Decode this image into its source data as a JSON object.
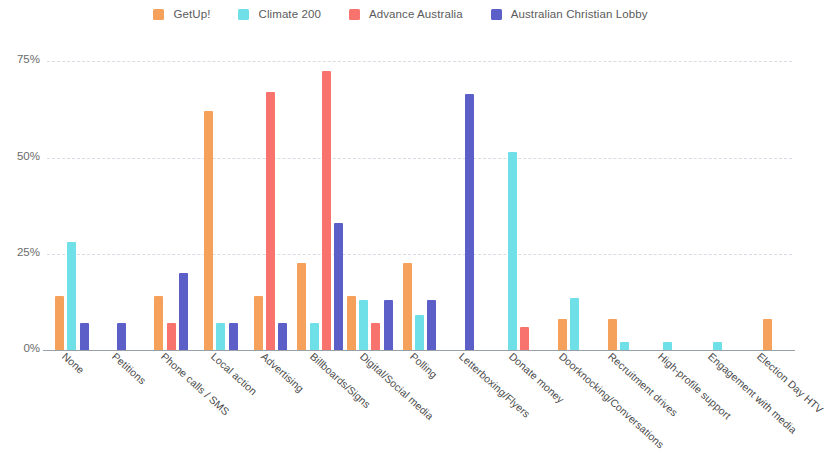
{
  "legend": {
    "position": "top-center",
    "items": [
      {
        "label": "GetUp!",
        "color": "#F5A15C",
        "icon": "legend-swatch"
      },
      {
        "label": "Climate 200",
        "color": "#6FE0E8",
        "icon": "legend-swatch"
      },
      {
        "label": "Advance Australia",
        "color": "#F8726E",
        "icon": "legend-swatch"
      },
      {
        "label": "Australian Christian Lobby",
        "color": "#5B5FC7",
        "icon": "legend-swatch"
      }
    ]
  },
  "axis": {
    "y_ticks": [
      "0%",
      "25%",
      "50%",
      "75%"
    ],
    "y_tick_values": [
      0,
      25,
      50,
      75
    ]
  },
  "chart_data": {
    "type": "bar",
    "title": "",
    "subtitle": "",
    "xlabel": "",
    "ylabel": "",
    "ylim": [
      0,
      80
    ],
    "grid": true,
    "legend_position": "top-center",
    "categories": [
      "None",
      "Petitions",
      "Phone calls / SMS",
      "Local action",
      "Advertising",
      "Billboards/Signs",
      "Digital/Social media",
      "Polling",
      "Letterboxing/Flyers",
      "Donate money",
      "Doorknocking/Conversations",
      "Recruitment drives",
      "High-profile support",
      "Engagement with media",
      "Election Day HTV"
    ],
    "series": [
      {
        "name": "GetUp!",
        "color": "#F5A15C",
        "values": [
          14,
          0,
          14,
          62,
          14,
          22.5,
          14,
          22.5,
          0,
          0,
          8,
          8,
          0,
          0,
          8
        ]
      },
      {
        "name": "Climate 200",
        "color": "#6FE0E8",
        "values": [
          28,
          0,
          0,
          7,
          0,
          7,
          13,
          9,
          0,
          51.5,
          13.5,
          2,
          2,
          2,
          0
        ]
      },
      {
        "name": "Advance Australia",
        "color": "#F8726E",
        "values": [
          0,
          0,
          7,
          0,
          67,
          72.5,
          7,
          0,
          0,
          6,
          0,
          0,
          0,
          0,
          0
        ]
      },
      {
        "name": "Australian Christian Lobby",
        "color": "#5B5FC7",
        "values": [
          7,
          7,
          20,
          7,
          7,
          33,
          13,
          13,
          66.5,
          0,
          0,
          0,
          0,
          0,
          0
        ]
      }
    ]
  }
}
